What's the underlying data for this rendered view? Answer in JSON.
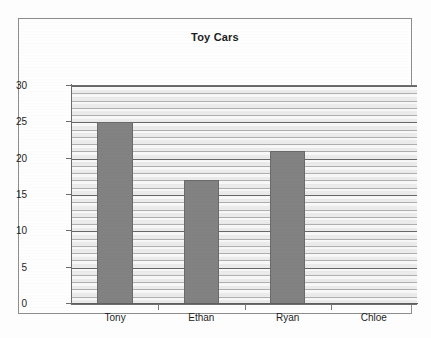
{
  "chart_data": {
    "type": "bar",
    "title": "Toy Cars",
    "categories": [
      "Tony",
      "Ethan",
      "Ryan",
      "Chloe"
    ],
    "values": [
      25,
      17,
      21,
      0
    ],
    "xlabel": "",
    "ylabel": "",
    "ylim": [
      0,
      30
    ],
    "ytick_labels": [
      "0",
      "5",
      "10",
      "15",
      "20",
      "25",
      "30"
    ],
    "ytick_values": [
      0,
      5,
      10,
      15,
      20,
      25,
      30
    ],
    "grid": true,
    "grid_minor_step": 1,
    "grid_major_step": 5,
    "legend": false,
    "legend_position": "none",
    "bar_color": "#828282",
    "bar_border_color": "#6a6a6a",
    "gridline_color": "#5a5a5a",
    "axis_color": "#6b6b6b",
    "frame_color": "#8d8d8d",
    "background_color": "#fdfdfd",
    "text_color": "#1d1d1d"
  }
}
